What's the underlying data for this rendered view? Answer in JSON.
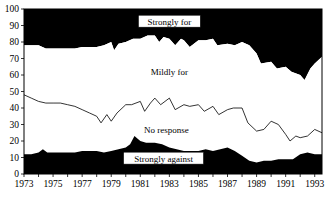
{
  "chart_data": {
    "type": "area",
    "title": "",
    "subtitle": "",
    "xlabel": "",
    "ylabel": "",
    "xlim": [
      1973,
      1993.5
    ],
    "ylim": [
      0,
      100
    ],
    "grid": false,
    "legend_position": "inline-annotations",
    "stacked": true,
    "x": [
      1973,
      1973.5,
      1974,
      1974.5,
      1975,
      1975.5,
      1976,
      1976.5,
      1977,
      1977.5,
      1978,
      1978.5,
      1979,
      1979.5,
      1980,
      1980.5,
      1981,
      1981.5,
      1982,
      1982.5,
      1983,
      1983.5,
      1984,
      1984.5,
      1985,
      1985.5,
      1986,
      1986.5,
      1987,
      1987.5,
      1988,
      1988.5,
      1989,
      1989.5,
      1990,
      1990.5,
      1991,
      1991.5,
      1992,
      1992.5,
      1993,
      1993.5
    ],
    "x_tick_labels": [
      "1973",
      "1975",
      "1977",
      "1979",
      "1981",
      "1983",
      "1985",
      "1987",
      "1989",
      "1991",
      "1993"
    ],
    "x_tick_values": [
      1973,
      1975,
      1977,
      1979,
      1981,
      1983,
      1985,
      1987,
      1989,
      1991,
      1993
    ],
    "y_tick_labels": [
      "0",
      "10",
      "20",
      "30",
      "40",
      "50",
      "60",
      "70",
      "80",
      "90",
      "100"
    ],
    "y_tick_values": [
      0,
      10,
      20,
      30,
      40,
      50,
      60,
      70,
      80,
      90,
      100
    ],
    "series": [
      {
        "name": "Strongly against",
        "color": "#000000",
        "cumulative_top": [
          12,
          12,
          13,
          15,
          13,
          13,
          13,
          13,
          14,
          14,
          14,
          13,
          14,
          15,
          16,
          17,
          23,
          20,
          19,
          19,
          18,
          16,
          15,
          14,
          14,
          14,
          15,
          14,
          15,
          16,
          14,
          11,
          8,
          7,
          8,
          8,
          9,
          9,
          9,
          12,
          13,
          12
        ]
      },
      {
        "name": "No response",
        "color": "#ffffff",
        "cumulative_top": [
          48,
          46,
          44,
          43,
          43,
          43,
          42,
          41,
          39,
          37,
          35,
          31,
          35,
          37,
          32,
          36,
          42,
          42,
          44,
          46,
          44,
          42,
          39,
          44,
          43,
          41,
          42,
          38,
          37,
          35,
          38,
          40,
          39,
          30,
          26,
          27,
          32,
          30,
          24,
          20,
          22,
          23,
          21,
          22,
          26,
          27,
          25,
          25
        ]
      },
      {
        "name": "Mildly for",
        "color": "#ffffff",
        "cumulative_top": [
          78,
          78,
          77,
          76,
          76,
          76,
          76,
          76,
          77,
          77,
          78,
          78,
          80,
          75,
          79,
          80,
          82,
          82,
          84,
          84,
          82,
          80,
          83,
          81,
          78,
          81,
          81,
          82,
          79,
          78,
          79,
          78,
          80,
          78,
          73,
          69,
          68,
          65,
          63,
          64,
          62,
          57,
          60,
          64,
          67,
          70,
          71
        ]
      },
      {
        "name": "Strongly for",
        "color": "#000000",
        "cumulative_top": [
          100,
          100,
          100,
          100,
          100,
          100,
          100,
          100,
          100,
          100,
          100,
          100,
          100,
          100,
          100,
          100,
          100,
          100,
          100,
          100,
          100,
          100,
          100,
          100,
          100,
          100,
          100,
          100,
          100,
          100,
          100,
          100,
          100,
          100,
          100,
          100,
          100,
          100,
          100,
          100,
          100,
          100
        ]
      }
    ],
    "boundary_strongly_against": [
      [
        1973,
        12
      ],
      [
        1973.5,
        12
      ],
      [
        1974,
        13
      ],
      [
        1974.3,
        15
      ],
      [
        1974.6,
        13
      ],
      [
        1975,
        13
      ],
      [
        1975.5,
        13
      ],
      [
        1976,
        13
      ],
      [
        1976.5,
        13
      ],
      [
        1977,
        14
      ],
      [
        1977.5,
        14
      ],
      [
        1978,
        14
      ],
      [
        1978.5,
        13
      ],
      [
        1979,
        14
      ],
      [
        1979.5,
        15
      ],
      [
        1980,
        16
      ],
      [
        1980.3,
        18
      ],
      [
        1980.6,
        23
      ],
      [
        1981,
        20
      ],
      [
        1981.4,
        19
      ],
      [
        1982,
        19
      ],
      [
        1982.5,
        18
      ],
      [
        1983,
        16
      ],
      [
        1983.5,
        15
      ],
      [
        1984,
        14
      ],
      [
        1984.5,
        14
      ],
      [
        1985,
        14
      ],
      [
        1985.5,
        15
      ],
      [
        1986,
        14
      ],
      [
        1986.5,
        15
      ],
      [
        1987,
        16
      ],
      [
        1987.5,
        14
      ],
      [
        1988,
        11
      ],
      [
        1988.5,
        8
      ],
      [
        1989,
        7
      ],
      [
        1989.5,
        8
      ],
      [
        1990,
        8
      ],
      [
        1990.5,
        9
      ],
      [
        1991,
        9
      ],
      [
        1991.5,
        9
      ],
      [
        1992,
        12
      ],
      [
        1992.5,
        13
      ],
      [
        1993,
        12
      ],
      [
        1993.5,
        12
      ]
    ],
    "boundary_no_response": [
      [
        1973,
        48
      ],
      [
        1973.5,
        46
      ],
      [
        1974,
        44
      ],
      [
        1974.5,
        43
      ],
      [
        1975,
        43
      ],
      [
        1975.5,
        43
      ],
      [
        1976,
        42
      ],
      [
        1976.5,
        41
      ],
      [
        1977,
        39
      ],
      [
        1977.5,
        37
      ],
      [
        1978,
        35
      ],
      [
        1978.3,
        31
      ],
      [
        1978.7,
        36
      ],
      [
        1979,
        32
      ],
      [
        1979.4,
        37
      ],
      [
        1980,
        42
      ],
      [
        1980.4,
        42
      ],
      [
        1981,
        44
      ],
      [
        1981.3,
        38
      ],
      [
        1981.7,
        43
      ],
      [
        1982,
        46
      ],
      [
        1982.4,
        42
      ],
      [
        1983,
        46
      ],
      [
        1983.4,
        39
      ],
      [
        1984,
        42
      ],
      [
        1984.4,
        41
      ],
      [
        1985,
        42
      ],
      [
        1985.4,
        38
      ],
      [
        1986,
        41
      ],
      [
        1986.4,
        36
      ],
      [
        1987,
        39
      ],
      [
        1987.4,
        40
      ],
      [
        1988,
        40
      ],
      [
        1988.4,
        31
      ],
      [
        1989,
        26
      ],
      [
        1989.5,
        27
      ],
      [
        1990,
        32
      ],
      [
        1990.5,
        30
      ],
      [
        1991,
        24
      ],
      [
        1991.3,
        20
      ],
      [
        1991.7,
        23
      ],
      [
        1992,
        22
      ],
      [
        1992.5,
        23
      ],
      [
        1993,
        27
      ],
      [
        1993.5,
        25
      ]
    ],
    "boundary_mildly_for": [
      [
        1973,
        78
      ],
      [
        1974,
        78
      ],
      [
        1974.5,
        76
      ],
      [
        1975,
        76
      ],
      [
        1976,
        76
      ],
      [
        1976.5,
        76
      ],
      [
        1977,
        77
      ],
      [
        1978,
        77
      ],
      [
        1978.5,
        78
      ],
      [
        1979,
        80
      ],
      [
        1979.2,
        75
      ],
      [
        1979.5,
        79
      ],
      [
        1980,
        80
      ],
      [
        1980.5,
        82
      ],
      [
        1981,
        82
      ],
      [
        1981.5,
        84
      ],
      [
        1982,
        84
      ],
      [
        1982.3,
        80
      ],
      [
        1982.6,
        83
      ],
      [
        1983,
        82
      ],
      [
        1983.4,
        78
      ],
      [
        1983.8,
        82
      ],
      [
        1984,
        81
      ],
      [
        1984.4,
        77
      ],
      [
        1985,
        81
      ],
      [
        1985.5,
        81
      ],
      [
        1986,
        82
      ],
      [
        1986.3,
        78
      ],
      [
        1987,
        79
      ],
      [
        1987.5,
        78
      ],
      [
        1988,
        80
      ],
      [
        1988.5,
        78
      ],
      [
        1989,
        73
      ],
      [
        1989.3,
        67
      ],
      [
        1990,
        68
      ],
      [
        1990.4,
        64
      ],
      [
        1991,
        65
      ],
      [
        1991.4,
        62
      ],
      [
        1992,
        60
      ],
      [
        1992.3,
        57
      ],
      [
        1992.7,
        64
      ],
      [
        1993,
        67
      ],
      [
        1993.5,
        71
      ]
    ],
    "annotations": [
      {
        "text": "Strongly for",
        "x": 1983.0,
        "y": 92,
        "boxed": true
      },
      {
        "text": "Mildly for",
        "x": 1983.0,
        "y": 62,
        "boxed": false
      },
      {
        "text": "No response",
        "x": 1982.8,
        "y": 27,
        "boxed": false
      },
      {
        "text": "Strongly against",
        "x": 1982.6,
        "y": 9,
        "boxed": true
      }
    ]
  }
}
